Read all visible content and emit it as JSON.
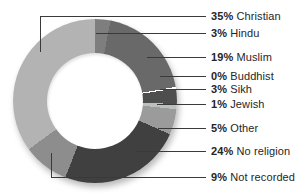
{
  "figure": {
    "background": "#ffffff",
    "title": ""
  },
  "chart_data": {
    "type": "pie",
    "variant": "donut",
    "title": "",
    "unit": "%",
    "direction": "clockwise",
    "start": "12 o'clock",
    "slices": [
      {
        "label": "Hindu",
        "value": 3,
        "color": "#7e7e7e"
      },
      {
        "label": "Muslim",
        "value": 19,
        "color": "#696969"
      },
      {
        "label": "Buddhist",
        "value": 0,
        "color": "#ffffff"
      },
      {
        "label": "Sikh",
        "value": 3,
        "color": "#4e4e4e"
      },
      {
        "label": "Jewish",
        "value": 1,
        "color": "#bcbfbf"
      },
      {
        "label": "Other",
        "value": 5,
        "color": "#9b9b9b"
      },
      {
        "label": "No religion",
        "value": 24,
        "color": "#404040"
      },
      {
        "label": "Not recorded",
        "value": 9,
        "color": "#8d8d8d"
      },
      {
        "label": "Christian",
        "value": 35,
        "color": "#b3b3b3"
      }
    ]
  },
  "legend": {
    "label_x": 211,
    "entries": [
      {
        "pct": "35%",
        "name": "Christian",
        "y": 16,
        "x1": 40,
        "x2": 206,
        "elbow_y": 52
      },
      {
        "pct": "3%",
        "name": "Hindu",
        "y": 33,
        "x1": 96,
        "x2": 206
      },
      {
        "pct": "19%",
        "name": "Muslim",
        "y": 57,
        "x1": 147,
        "x2": 206
      },
      {
        "pct": "0%",
        "name": "Buddhist",
        "y": 76,
        "x1": 160,
        "x2": 206
      },
      {
        "pct": "3%",
        "name": "Sikh",
        "y": 89,
        "x1": 160,
        "x2": 206
      },
      {
        "pct": "1%",
        "name": "Jewish",
        "y": 104,
        "x1": 157,
        "x2": 206
      },
      {
        "pct": "5%",
        "name": "Other",
        "y": 128,
        "x1": 158,
        "x2": 206
      },
      {
        "pct": "24%",
        "name": "No religion",
        "y": 151,
        "x1": 135,
        "x2": 206
      },
      {
        "pct": "9%",
        "name": "Not recorded",
        "y": 177,
        "x1": 51,
        "x2": 206,
        "elbow_y": 153
      }
    ]
  },
  "styles": {
    "line_color": "#3a3a3a",
    "label_color": "#262626"
  }
}
